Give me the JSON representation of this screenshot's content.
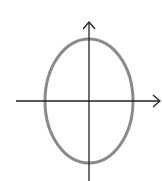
{
  "figure": {
    "label": ")",
    "axes": {
      "color": "#222222",
      "x_axis": {
        "x1": 16,
        "x2": 160,
        "y": 101,
        "arrow": "right"
      },
      "y_axis": {
        "x": 89,
        "y1": 181,
        "y2": 22,
        "arrow": "up"
      }
    },
    "ellipse": {
      "cx": 89,
      "cy": 101,
      "rx": 44,
      "ry": 62,
      "stroke": "#8a8a8a",
      "stroke_width": 3
    }
  }
}
